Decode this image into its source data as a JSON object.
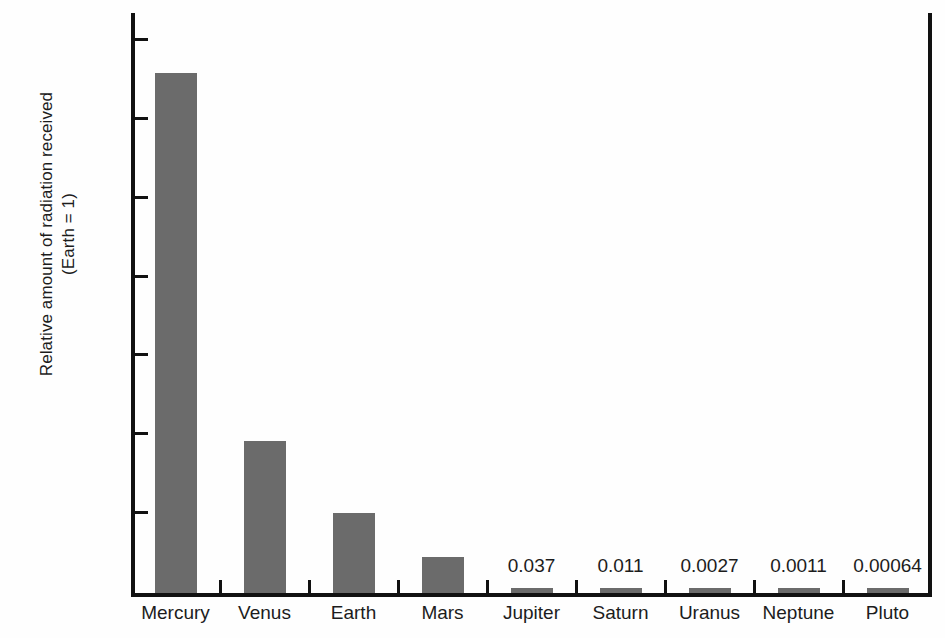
{
  "chart_data": {
    "type": "bar",
    "title": "",
    "xlabel": "",
    "ylabel": "Relative amount of radiation received\n(Earth = 1)",
    "ylabel_line1": "Relative amount of radiation received",
    "ylabel_line2": "(Earth = 1)",
    "categories": [
      "Mercury",
      "Venus",
      "Earth",
      "Mars",
      "Jupiter",
      "Saturn",
      "Uranus",
      "Neptune",
      "Pluto"
    ],
    "values": [
      6.6,
      1.93,
      1.02,
      0.46,
      0.037,
      0.011,
      0.0027,
      0.0011,
      0.00064
    ],
    "value_labels": [
      "",
      "",
      "",
      "",
      "0.037",
      "0.011",
      "0.0027",
      "0.0011",
      "0.00064"
    ],
    "ylim": [
      0,
      7.4
    ],
    "ytick_values": [
      0,
      1,
      2,
      3,
      4,
      5,
      6,
      7
    ],
    "ytick_labels": [
      "0.00",
      "1.00",
      "2.00",
      "3.00",
      "4.00",
      "5.00",
      "6.00",
      "7.00"
    ],
    "grid": false,
    "legend": null,
    "bar_color": "#6b6b6b",
    "axis_color": "#111111",
    "background_color": "#fefefe"
  }
}
